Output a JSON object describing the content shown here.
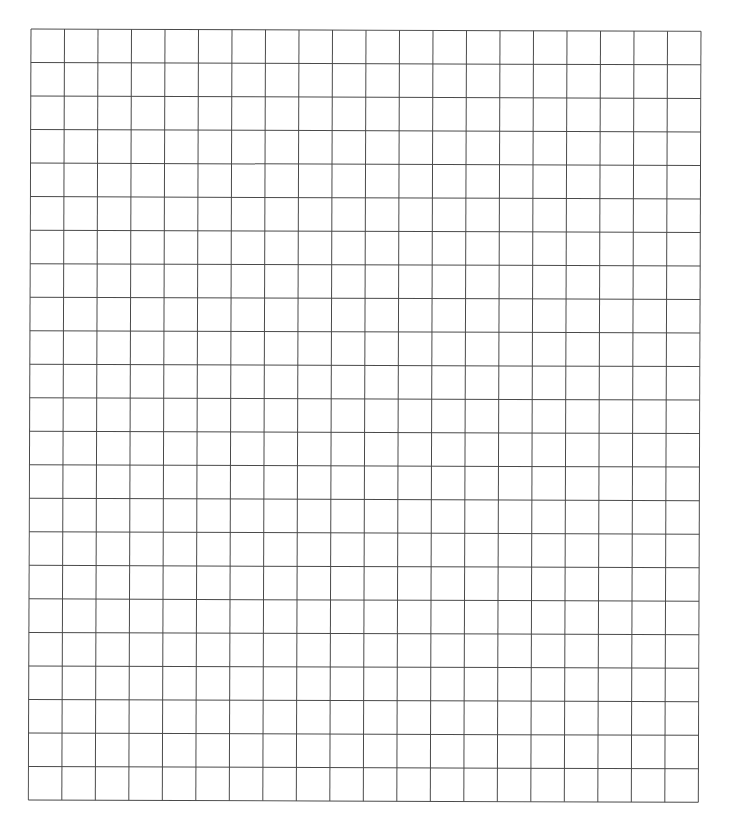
{
  "grid": {
    "columns": 20,
    "rows": 23,
    "line_color": "#4a4a4a",
    "background": "#ffffff",
    "cell_width": 33.5,
    "cell_height": 33.5
  }
}
